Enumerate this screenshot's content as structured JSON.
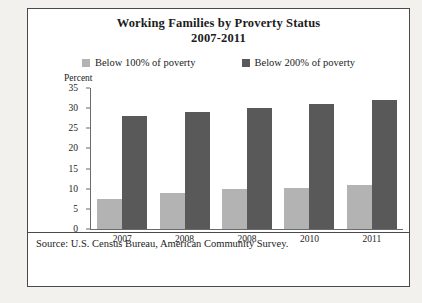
{
  "figure": {
    "title_line1": "Working Families by Proverty Status",
    "title_line2": "2007-2011",
    "source": "Source: U.S. Census Bureau, American Community Survey."
  },
  "legend": {
    "items": [
      {
        "label": "Below 100% of poverty",
        "color": "#b3b3b3",
        "swatch_name": "legend-swatch-below-100"
      },
      {
        "label": "Below 200% of poverty",
        "color": "#595959",
        "swatch_name": "legend-swatch-below-200"
      }
    ]
  },
  "axes": {
    "y_title": "Percent",
    "y_ticks": [
      "0",
      "5",
      "10",
      "15",
      "20",
      "25",
      "30",
      "35"
    ],
    "x_labels": [
      "2007",
      "2008",
      "2008",
      "2010",
      "2011"
    ]
  },
  "chart_data": {
    "type": "bar",
    "title": "Working Families by Proverty Status 2007-2011",
    "xlabel": "",
    "ylabel": "Percent",
    "ylim": [
      0,
      35
    ],
    "ytick_step": 5,
    "grid": false,
    "legend_position": "top-center",
    "categories": [
      "2007",
      "2008",
      "2008",
      "2010",
      "2011"
    ],
    "series": [
      {
        "name": "Below 100% of poverty",
        "color": "#b3b3b3",
        "values": [
          7.5,
          9,
          10,
          10.2,
          11
        ]
      },
      {
        "name": "Below 200% of poverty",
        "color": "#595959",
        "values": [
          28,
          29,
          30,
          31,
          32
        ]
      }
    ],
    "source": "U.S. Census Bureau, American Community Survey."
  }
}
